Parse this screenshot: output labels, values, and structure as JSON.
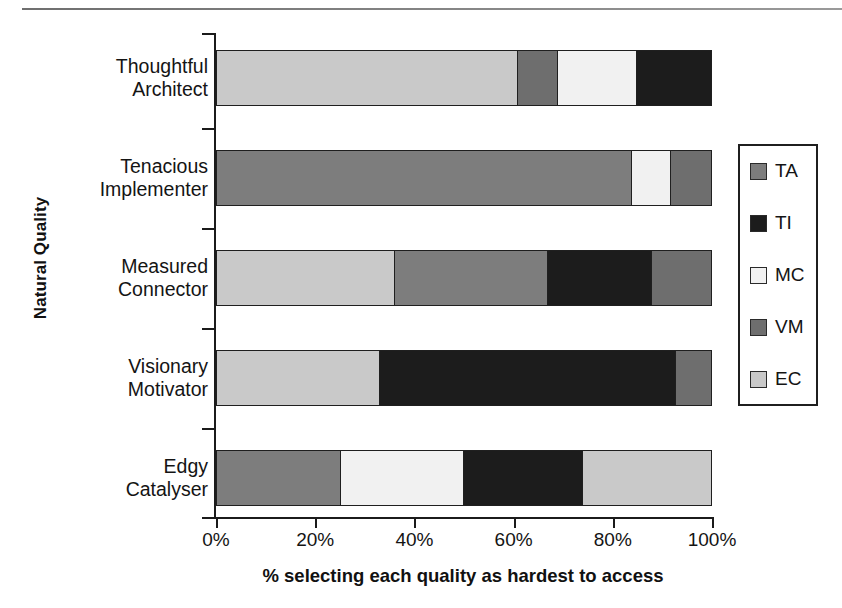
{
  "chart_data": {
    "type": "bar",
    "orientation": "horizontal",
    "stacked": true,
    "normalized": true,
    "title": "",
    "xlabel": "% selecting each quality as hardest to access",
    "ylabel": "Natural Quality",
    "xlim": [
      0,
      100
    ],
    "xticks": [
      0,
      20,
      40,
      60,
      80,
      100
    ],
    "xticklabels": [
      "0%",
      "20%",
      "40%",
      "60%",
      "80%",
      "100%"
    ],
    "grid": false,
    "legend_position": "right",
    "categories": [
      "Thoughtful Architect",
      "Tenacious Implementer",
      "Measured Connector",
      "Visionary Motivator",
      "Edgy Catalyser"
    ],
    "category_lines": [
      [
        "Thoughtful",
        "Architect"
      ],
      [
        "Tenacious",
        "Implementer"
      ],
      [
        "Measured",
        "Connector"
      ],
      [
        "Visionary",
        "Motivator"
      ],
      [
        "Edgy",
        "Catalyser"
      ]
    ],
    "series": [
      {
        "name": "TA",
        "color": "#7d7d7d",
        "values": [
          0,
          84,
          31,
          0,
          25
        ]
      },
      {
        "name": "TI",
        "color": "#1c1c1c",
        "values": [
          15,
          0,
          21,
          60,
          24
        ]
      },
      {
        "name": "MC",
        "color": "#f1f1f1",
        "values": [
          16,
          8,
          0,
          0,
          25
        ]
      },
      {
        "name": "VM",
        "color": "#6e6e6e",
        "values": [
          8,
          8,
          12,
          7,
          0
        ]
      },
      {
        "name": "EC",
        "color": "#c9c9c9",
        "values": [
          61,
          0,
          36,
          33,
          26
        ]
      }
    ],
    "bars": [
      {
        "category": "Thoughtful Architect",
        "segments": [
          {
            "series": "EC",
            "value": 61
          },
          {
            "series": "VM",
            "value": 8
          },
          {
            "series": "MC",
            "value": 16
          },
          {
            "series": "TI",
            "value": 15
          }
        ]
      },
      {
        "category": "Tenacious Implementer",
        "segments": [
          {
            "series": "TA",
            "value": 84
          },
          {
            "series": "MC",
            "value": 8
          },
          {
            "series": "VM",
            "value": 8
          }
        ]
      },
      {
        "category": "Measured Connector",
        "segments": [
          {
            "series": "EC",
            "value": 36
          },
          {
            "series": "TA",
            "value": 31
          },
          {
            "series": "TI",
            "value": 21
          },
          {
            "series": "VM",
            "value": 12
          }
        ]
      },
      {
        "category": "Visionary Motivator",
        "segments": [
          {
            "series": "EC",
            "value": 33
          },
          {
            "series": "TI",
            "value": 60
          },
          {
            "series": "VM",
            "value": 7
          }
        ]
      },
      {
        "category": "Edgy Catalyser",
        "segments": [
          {
            "series": "TA",
            "value": 25
          },
          {
            "series": "MC",
            "value": 25
          },
          {
            "series": "TI",
            "value": 24
          },
          {
            "series": "EC",
            "value": 26
          }
        ]
      }
    ],
    "legend": [
      {
        "label": "TA",
        "color": "#7d7d7d"
      },
      {
        "label": "TI",
        "color": "#1c1c1c"
      },
      {
        "label": "MC",
        "color": "#f1f1f1"
      },
      {
        "label": "VM",
        "color": "#6e6e6e"
      },
      {
        "label": "EC",
        "color": "#c9c9c9"
      }
    ]
  }
}
